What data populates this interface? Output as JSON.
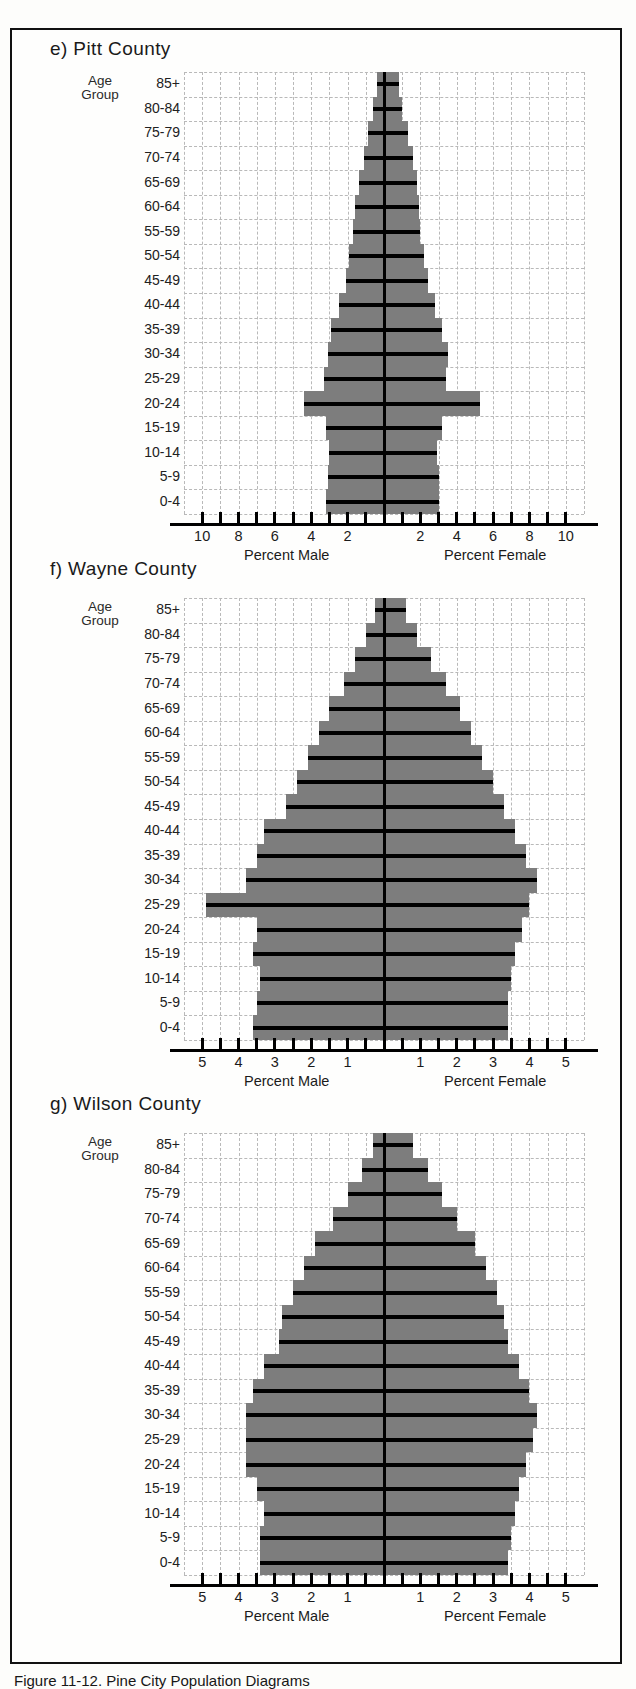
{
  "figure": {
    "caption": "Figure 11-12.    Pine City Population Diagrams",
    "age_group_heading_line1": "Age",
    "age_group_heading_line2": "Group",
    "male_axis_title": "Percent Male",
    "female_axis_title": "Percent Female",
    "bar_color": "#7d7d7d",
    "rule_color": "#000000",
    "grid_color": "#b9b9b9"
  },
  "age_groups": [
    "85+",
    "80-84",
    "75-79",
    "70-74",
    "65-69",
    "60-64",
    "55-59",
    "50-54",
    "45-49",
    "40-44",
    "35-39",
    "30-34",
    "25-29",
    "20-24",
    "15-19",
    "10-14",
    "5-9",
    "0-4"
  ],
  "chart_data": [
    {
      "type": "bar",
      "panel": "e",
      "title": "e) Pitt County",
      "orientation": "population-pyramid",
      "xlabel_left": "Percent Male",
      "xlabel_right": "Percent Female",
      "ylabel": "Age Group",
      "grid": true,
      "xlim": [
        -11,
        11
      ],
      "xticks": [
        10,
        8,
        6,
        4,
        2,
        0,
        2,
        4,
        6,
        8,
        10
      ],
      "xtick_labels": [
        "10",
        "8",
        "6",
        "4",
        "2",
        "",
        "2",
        "4",
        "6",
        "8",
        "10"
      ],
      "categories": [
        "85+",
        "80-84",
        "75-79",
        "70-74",
        "65-69",
        "60-64",
        "55-59",
        "50-54",
        "45-49",
        "40-44",
        "35-39",
        "30-34",
        "25-29",
        "20-24",
        "15-19",
        "10-14",
        "5-9",
        "0-4"
      ],
      "series": [
        {
          "name": "Percent Male",
          "values": [
            0.4,
            0.6,
            0.9,
            1.1,
            1.4,
            1.6,
            1.7,
            1.9,
            2.1,
            2.5,
            2.9,
            3.1,
            3.3,
            4.4,
            3.2,
            3.0,
            3.1,
            3.2
          ]
        },
        {
          "name": "Percent Female",
          "values": [
            0.8,
            1.0,
            1.3,
            1.6,
            1.8,
            1.9,
            2.0,
            2.2,
            2.4,
            2.8,
            3.2,
            3.5,
            3.4,
            5.3,
            3.2,
            2.9,
            3.0,
            3.0
          ]
        }
      ]
    },
    {
      "type": "bar",
      "panel": "f",
      "title": "f) Wayne County",
      "orientation": "population-pyramid",
      "xlabel_left": "Percent Male",
      "xlabel_right": "Percent Female",
      "ylabel": "Age Group",
      "grid": true,
      "xlim": [
        -5.5,
        5.5
      ],
      "xticks": [
        5,
        4,
        3,
        2,
        1,
        0,
        1,
        2,
        3,
        4,
        5
      ],
      "xtick_labels": [
        "5",
        "4",
        "3",
        "2",
        "1",
        "",
        "1",
        "2",
        "3",
        "4",
        "5"
      ],
      "categories": [
        "85+",
        "80-84",
        "75-79",
        "70-74",
        "65-69",
        "60-64",
        "55-59",
        "50-54",
        "45-49",
        "40-44",
        "35-39",
        "30-34",
        "25-29",
        "20-24",
        "15-19",
        "10-14",
        "5-9",
        "0-4"
      ],
      "series": [
        {
          "name": "Percent Male",
          "values": [
            0.25,
            0.5,
            0.8,
            1.1,
            1.5,
            1.8,
            2.1,
            2.4,
            2.7,
            3.3,
            3.5,
            3.8,
            4.9,
            3.5,
            3.6,
            3.4,
            3.5,
            3.6
          ]
        },
        {
          "name": "Percent Female",
          "values": [
            0.6,
            0.9,
            1.3,
            1.7,
            2.1,
            2.4,
            2.7,
            3.0,
            3.3,
            3.6,
            3.9,
            4.2,
            4.0,
            3.8,
            3.6,
            3.5,
            3.4,
            3.4
          ]
        }
      ]
    },
    {
      "type": "bar",
      "panel": "g",
      "title": "g) Wilson County",
      "orientation": "population-pyramid",
      "xlabel_left": "Percent Male",
      "xlabel_right": "Percent Female",
      "ylabel": "Age Group",
      "grid": true,
      "xlim": [
        -5.5,
        5.5
      ],
      "xticks": [
        5,
        4,
        3,
        2,
        1,
        0,
        1,
        2,
        3,
        4,
        5
      ],
      "xtick_labels": [
        "5",
        "4",
        "3",
        "2",
        "1",
        "",
        "1",
        "2",
        "3",
        "4",
        "5"
      ],
      "categories": [
        "85+",
        "80-84",
        "75-79",
        "70-74",
        "65-69",
        "60-64",
        "55-59",
        "50-54",
        "45-49",
        "40-44",
        "35-39",
        "30-34",
        "25-29",
        "20-24",
        "15-19",
        "10-14",
        "5-9",
        "0-4"
      ],
      "series": [
        {
          "name": "Percent Male",
          "values": [
            0.3,
            0.6,
            1.0,
            1.4,
            1.9,
            2.2,
            2.5,
            2.8,
            2.9,
            3.3,
            3.6,
            3.8,
            3.8,
            3.8,
            3.5,
            3.3,
            3.4,
            3.4
          ]
        },
        {
          "name": "Percent Female",
          "values": [
            0.8,
            1.2,
            1.6,
            2.0,
            2.5,
            2.8,
            3.1,
            3.3,
            3.4,
            3.7,
            4.0,
            4.2,
            4.1,
            3.9,
            3.7,
            3.6,
            3.5,
            3.4
          ]
        }
      ]
    }
  ]
}
